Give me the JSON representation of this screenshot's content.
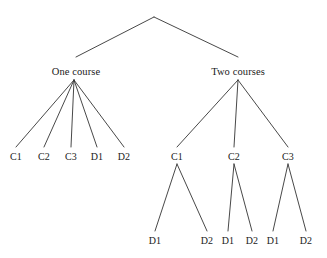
{
  "figure": {
    "kind": "tree-diagram",
    "background_color": "#ffffff",
    "line_color": "#333333",
    "text_color": "#1a1a1a"
  },
  "chart_data": {
    "type": "diagram",
    "subtype": "tree",
    "orientation": "top-down",
    "root": {
      "label": "",
      "x": 154,
      "y": 17,
      "children": [
        "one-course",
        "two-courses"
      ]
    },
    "nodes": [
      {
        "id": "one-course",
        "label": "One course",
        "level": 1,
        "x": 76,
        "y": 71,
        "parent": "root"
      },
      {
        "id": "two-courses",
        "label": "Two courses",
        "level": 1,
        "x": 238,
        "y": 71,
        "parent": "root"
      },
      {
        "id": "one-c1",
        "label": "C1",
        "level": 2,
        "x": 16,
        "y": 156,
        "parent": "one-course"
      },
      {
        "id": "one-c2",
        "label": "C2",
        "level": 2,
        "x": 44,
        "y": 156,
        "parent": "one-course"
      },
      {
        "id": "one-c3",
        "label": "C3",
        "level": 2,
        "x": 71,
        "y": 156,
        "parent": "one-course"
      },
      {
        "id": "one-d1",
        "label": "D1",
        "level": 2,
        "x": 97,
        "y": 156,
        "parent": "one-course"
      },
      {
        "id": "one-d2",
        "label": "D2",
        "level": 2,
        "x": 124,
        "y": 156,
        "parent": "one-course"
      },
      {
        "id": "two-c1",
        "label": "C1",
        "level": 2,
        "x": 177,
        "y": 156,
        "parent": "two-courses"
      },
      {
        "id": "two-c2",
        "label": "C2",
        "level": 2,
        "x": 234,
        "y": 156,
        "parent": "two-courses"
      },
      {
        "id": "two-c3",
        "label": "C3",
        "level": 2,
        "x": 288,
        "y": 156,
        "parent": "two-courses"
      },
      {
        "id": "two-c1-d1",
        "label": "D1",
        "level": 3,
        "x": 155,
        "y": 240,
        "parent": "two-c1"
      },
      {
        "id": "two-c1-d2",
        "label": "D2",
        "level": 3,
        "x": 207,
        "y": 240,
        "parent": "two-c1"
      },
      {
        "id": "two-c2-d1",
        "label": "D1",
        "level": 3,
        "x": 228,
        "y": 240,
        "parent": "two-c2"
      },
      {
        "id": "two-c2-d2",
        "label": "D2",
        "level": 3,
        "x": 252,
        "y": 240,
        "parent": "two-c2"
      },
      {
        "id": "two-c3-d1",
        "label": "D1",
        "level": 3,
        "x": 273,
        "y": 240,
        "parent": "two-c3"
      },
      {
        "id": "two-c3-d2",
        "label": "D2",
        "level": 3,
        "x": 306,
        "y": 240,
        "parent": "two-c3"
      }
    ],
    "edges": [
      {
        "from": "root",
        "to": "one-course",
        "x1": 154,
        "y1": 17,
        "x2": 76,
        "y2": 57
      },
      {
        "from": "root",
        "to": "two-courses",
        "x1": 154,
        "y1": 17,
        "x2": 238,
        "y2": 57
      },
      {
        "from": "one-course",
        "to": "one-c1",
        "x1": 74,
        "y1": 80,
        "x2": 16,
        "y2": 147
      },
      {
        "from": "one-course",
        "to": "one-c2",
        "x1": 74,
        "y1": 80,
        "x2": 44,
        "y2": 147
      },
      {
        "from": "one-course",
        "to": "one-c3",
        "x1": 74,
        "y1": 80,
        "x2": 71,
        "y2": 147
      },
      {
        "from": "one-course",
        "to": "one-d1",
        "x1": 74,
        "y1": 80,
        "x2": 97,
        "y2": 147
      },
      {
        "from": "one-course",
        "to": "one-d2",
        "x1": 74,
        "y1": 80,
        "x2": 124,
        "y2": 147
      },
      {
        "from": "two-courses",
        "to": "two-c1",
        "x1": 238,
        "y1": 80,
        "x2": 177,
        "y2": 147
      },
      {
        "from": "two-courses",
        "to": "two-c2",
        "x1": 238,
        "y1": 80,
        "x2": 234,
        "y2": 147
      },
      {
        "from": "two-courses",
        "to": "two-c3",
        "x1": 238,
        "y1": 80,
        "x2": 288,
        "y2": 147
      },
      {
        "from": "two-c1",
        "to": "two-c1-d1",
        "x1": 177,
        "y1": 164,
        "x2": 155,
        "y2": 231
      },
      {
        "from": "two-c1",
        "to": "two-c1-d2",
        "x1": 177,
        "y1": 164,
        "x2": 207,
        "y2": 231
      },
      {
        "from": "two-c2",
        "to": "two-c2-d1",
        "x1": 234,
        "y1": 164,
        "x2": 228,
        "y2": 231
      },
      {
        "from": "two-c2",
        "to": "two-c2-d2",
        "x1": 234,
        "y1": 164,
        "x2": 252,
        "y2": 231
      },
      {
        "from": "two-c3",
        "to": "two-c3-d1",
        "x1": 288,
        "y1": 164,
        "x2": 273,
        "y2": 231
      },
      {
        "from": "two-c3",
        "to": "two-c3-d2",
        "x1": 288,
        "y1": 164,
        "x2": 306,
        "y2": 231
      }
    ],
    "labels": {
      "branch_one": "One course",
      "branch_two": "Two courses",
      "one_leaves": [
        "C1",
        "C2",
        "C3",
        "D1",
        "D2"
      ],
      "two_c_level": [
        "C1",
        "C2",
        "C3"
      ],
      "two_d_level": [
        "D1",
        "D2",
        "D1",
        "D2",
        "D1",
        "D2"
      ]
    }
  }
}
